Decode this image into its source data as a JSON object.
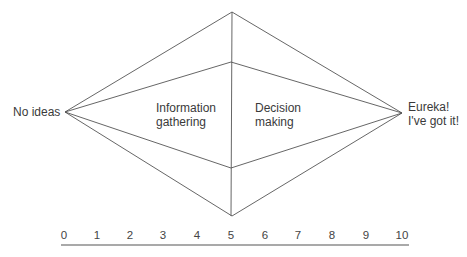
{
  "diagram": {
    "type": "diamond-process-diagram",
    "left_label": "No ideas",
    "right_label_line1": "Eureka!",
    "right_label_line2": "I've got it!",
    "left_region_line1": "Information",
    "left_region_line2": "gathering",
    "right_region_line1": "Decision",
    "right_region_line2": "making",
    "line_color": "#555555"
  },
  "scale": {
    "ticks": [
      "0",
      "1",
      "2",
      "3",
      "4",
      "5",
      "6",
      "7",
      "8",
      "9",
      "10"
    ],
    "min": 0,
    "max": 10
  }
}
